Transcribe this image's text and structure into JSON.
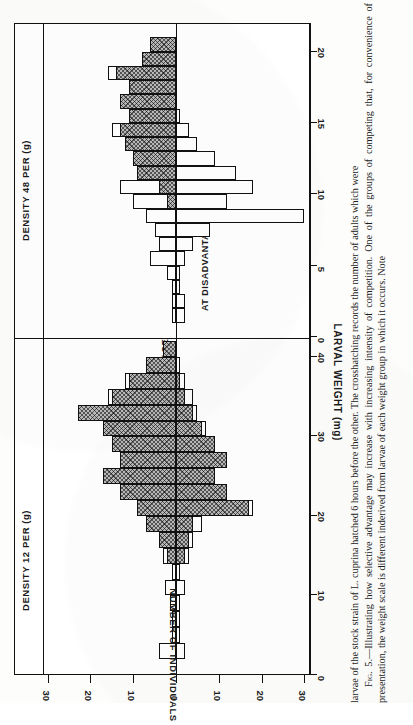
{
  "figure": {
    "panels": [
      {
        "id": "density12",
        "title": "DENSITY 12 PER (g)"
      },
      {
        "id": "density48",
        "title": "DENSITY 48 PER (g)"
      }
    ],
    "inline_labels": {
      "advantage": "6 HOURS ADVANTAGE",
      "disadvantage": "AT DISADVANTAGE"
    },
    "y_axis": {
      "label": "NUMBER OF INDIVIDUALS",
      "ticks": [
        "30",
        "20",
        "10",
        "0",
        "10",
        "20",
        "30"
      ]
    },
    "x_axis": {
      "label": "LARVAL WEIGHT (mg)",
      "panel_left_ticks": [
        "0",
        "10",
        "20",
        "30",
        "40"
      ],
      "panel_right_ticks": [
        "0",
        "5",
        "10",
        "15",
        "20"
      ]
    }
  },
  "caption": {
    "runon": "larvae of the stock strain of L. cuprina hatched 6 hours before the other. The crosshatching records the number of adults which were",
    "fig_no": "Fig. 5.",
    "body": "—Illustrating how selective advantage may increase with increasing intensity of competition. One of the groups of competing that, for convenience of presentation, the weight scale is different inderived from larvae of each weight group in which it occurs. Note"
  },
  "chart_data": {
    "type": "bar",
    "title": "Illustrating how selective advantage may increase with increasing intensity of competition",
    "xlabel": "LARVAL WEIGHT (mg)",
    "ylabel": "NUMBER OF INDIVIDUALS",
    "orientation": "back-to-back histogram, bars horizontal in printed orientation",
    "ylim": [
      -35,
      35
    ],
    "legend": [
      {
        "name": "crosshatched",
        "meaning": "number of adults derived from larvae of each weight group"
      },
      {
        "name": "open",
        "meaning": "total number of individuals in each weight group"
      }
    ],
    "panels": [
      {
        "name": "DENSITY 12 PER (g)",
        "xlim": [
          0,
          42
        ],
        "xticks": [
          0,
          10,
          20,
          30,
          40
        ],
        "bin_width": 2,
        "bins": [
          0,
          2,
          4,
          6,
          8,
          10,
          12,
          14,
          16,
          18,
          20,
          22,
          24,
          26,
          28,
          30,
          32,
          34,
          36,
          38,
          40
        ],
        "series": [
          {
            "name": "6 HOURS ADVANTAGE",
            "direction": "up",
            "open": [
              0,
              4,
              1,
              1,
              1.5,
              2.5,
              1,
              3,
              4,
              7,
              9,
              13,
              17,
              13,
              15,
              17,
              23,
              16,
              12,
              7,
              3
            ],
            "hatched": [
              0,
              0,
              0,
              0,
              0,
              0,
              0,
              2,
              4,
              7,
              9,
              13,
              17,
              13,
              15,
              17,
              23,
              15,
              11,
              7,
              3
            ]
          },
          {
            "name": "AT DISADVANTAGE",
            "direction": "down",
            "open": [
              0,
              2,
              1,
              1,
              1,
              2,
              1,
              3,
              4,
              6,
              18,
              12,
              9,
              12,
              9,
              7,
              5,
              4,
              2,
              1,
              0
            ],
            "hatched": [
              0,
              0,
              0,
              0,
              0,
              0,
              0,
              2,
              3,
              4,
              17,
              12,
              9,
              12,
              9,
              6,
              4,
              2,
              1,
              0,
              0
            ]
          }
        ]
      },
      {
        "name": "DENSITY 48 PER (g)",
        "xlim": [
          0,
          22
        ],
        "xticks": [
          0,
          5,
          10,
          15,
          20
        ],
        "bin_width": 1,
        "bins": [
          0,
          1,
          2,
          3,
          4,
          5,
          6,
          7,
          8,
          9,
          10,
          11,
          12,
          13,
          14,
          15,
          16,
          17,
          18,
          19,
          20,
          21
        ],
        "series": [
          {
            "name": "6 HOURS ADVANTAGE",
            "direction": "up",
            "open": [
              0,
              1,
              1,
              1,
              2,
              6,
              4,
              5,
              7,
              10,
              13,
              9,
              10,
              12,
              15,
              11,
              13,
              11,
              16,
              8,
              6,
              0
            ],
            "hatched": [
              0,
              0,
              0,
              0,
              0,
              0,
              0,
              0,
              0,
              2,
              4,
              9,
              10,
              12,
              13,
              11,
              13,
              11,
              14,
              8,
              6,
              0
            ]
          },
          {
            "name": "AT DISADVANTAGE",
            "direction": "down",
            "open": [
              0,
              2,
              2,
              1,
              1,
              2,
              4,
              8,
              30,
              12,
              18,
              14,
              9,
              5,
              3,
              1,
              0,
              0,
              0,
              0,
              0,
              0
            ],
            "hatched": [
              0,
              0,
              0,
              0,
              0,
              0,
              0,
              0,
              0,
              0,
              0,
              0,
              0,
              0,
              0,
              0,
              0,
              0,
              0,
              0,
              0,
              0
            ]
          }
        ]
      }
    ]
  }
}
